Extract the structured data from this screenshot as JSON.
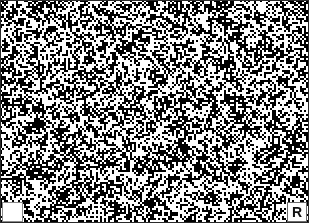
{
  "figure": {
    "kind": "binary-noise-micrograph",
    "width": 309,
    "height": 223,
    "background_color": "#ffffff",
    "foreground_color": "#000000",
    "border_color": "#2a2a2a"
  },
  "texture": {
    "type": "dithered-binary-noise",
    "black_coverage_percent": 48,
    "grain_size_px": 2,
    "smoothing_passes": 2,
    "seed": 20250117
  },
  "overlays": {
    "scalebar_box": {
      "label": "",
      "background_color": "#ffffff",
      "border_color": "#8a8a8a"
    },
    "orientation_marker": {
      "letter": "R",
      "background_color": "#ffffff",
      "border_color": "#6a6a6a",
      "text_color": "#101010"
    }
  }
}
